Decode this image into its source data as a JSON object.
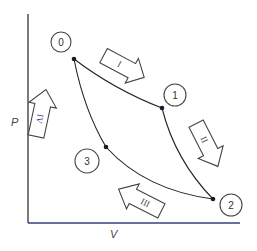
{
  "diagram": {
    "type": "pressure-volume cycle diagram",
    "axes": {
      "x_label": "V",
      "y_label": "P"
    },
    "states": [
      {
        "id": "0",
        "label": "0"
      },
      {
        "id": "1",
        "label": "1"
      },
      {
        "id": "2",
        "label": "2"
      },
      {
        "id": "3",
        "label": "3"
      }
    ],
    "processes": [
      {
        "id": "I",
        "label": "I",
        "from": "0",
        "to": "1"
      },
      {
        "id": "II",
        "label": "II",
        "from": "1",
        "to": "2"
      },
      {
        "id": "III",
        "label": "III",
        "from": "2",
        "to": "3"
      },
      {
        "id": "IV",
        "label": "IV",
        "from": "3",
        "to": "0"
      }
    ]
  }
}
